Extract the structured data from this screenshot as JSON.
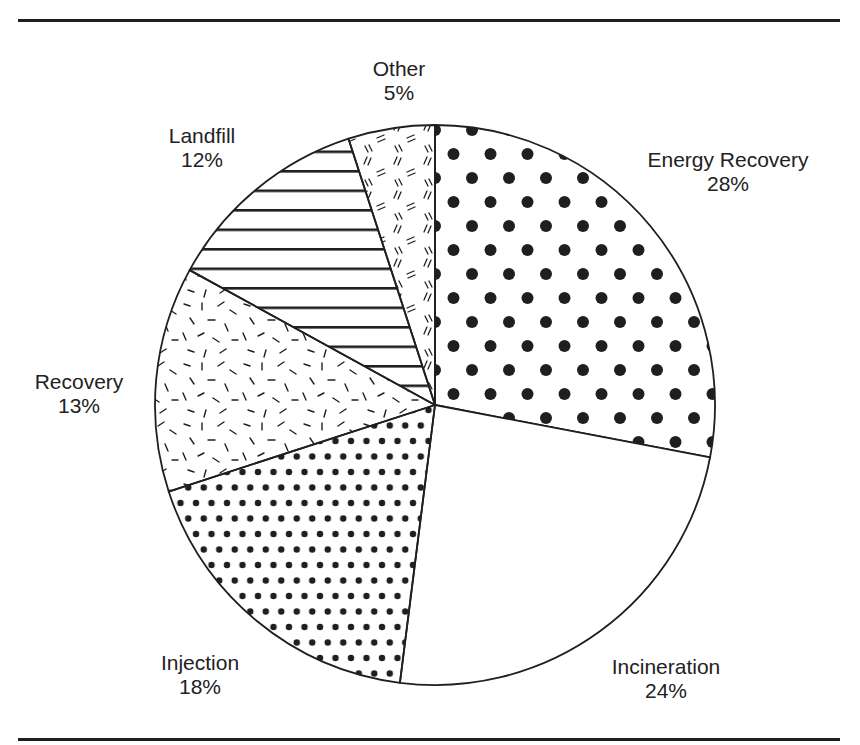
{
  "chart_data": {
    "type": "pie",
    "title": "",
    "start_angle_deg": 0,
    "direction": "clockwise",
    "slices": [
      {
        "label": "Energy Recovery",
        "value": 28,
        "display": "28%",
        "pattern": "large-dots"
      },
      {
        "label": "Incineration",
        "value": 24,
        "display": "24%",
        "pattern": "none"
      },
      {
        "label": "Injection",
        "value": 18,
        "display": "18%",
        "pattern": "small-dots"
      },
      {
        "label": "Recovery",
        "value": 13,
        "display": "13%",
        "pattern": "random-dashes"
      },
      {
        "label": "Landfill",
        "value": 12,
        "display": "12%",
        "pattern": "horizontal-lines"
      },
      {
        "label": "Other",
        "value": 5,
        "display": "5%",
        "pattern": "double-dashes"
      }
    ],
    "legend": "none (labels placed outside slices)",
    "units": "%"
  },
  "labels": {
    "energy_recovery": {
      "name": "Energy Recovery",
      "pct": "28%"
    },
    "incineration": {
      "name": "Incineration",
      "pct": "24%"
    },
    "injection": {
      "name": "Injection",
      "pct": "18%"
    },
    "recovery": {
      "name": "Recovery",
      "pct": "13%"
    },
    "landfill": {
      "name": "Landfill",
      "pct": "12%"
    },
    "other": {
      "name": "Other",
      "pct": "5%"
    }
  },
  "colors": {
    "ink": "#1f1f1f",
    "background": "#ffffff"
  }
}
